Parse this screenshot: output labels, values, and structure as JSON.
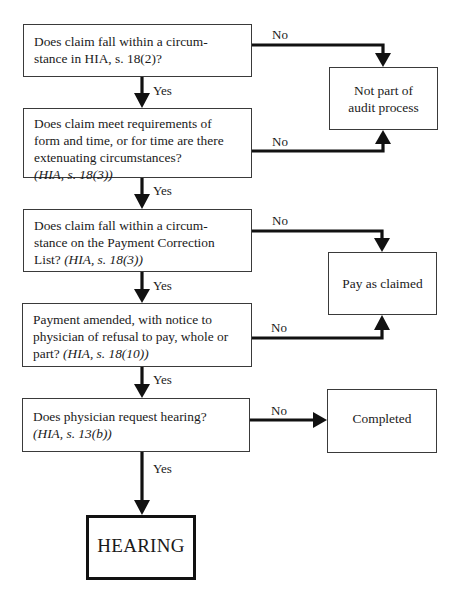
{
  "diagram": {
    "type": "flowchart",
    "decisions": [
      {
        "id": "q1",
        "text": "Does claim fall within a circum- stance in HIA, s. 18(2)?",
        "lines": [
          "Does claim fall within a circum-",
          "stance in HIA, s. 18(2)?"
        ],
        "ref": ""
      },
      {
        "id": "q2",
        "lines": [
          "Does claim meet requirements of",
          "form and time, or for time are there",
          "extenuating circumstances?"
        ],
        "ref": "(HIA, s. 18(3))"
      },
      {
        "id": "q3",
        "lines": [
          "Does claim fall within a circum-",
          "stance on the Payment Correction",
          "List? "
        ],
        "ref": "(HIA, s. 18(3))"
      },
      {
        "id": "q4",
        "lines": [
          "Payment amended, with notice to",
          "physician of refusal to pay, whole or",
          "part? "
        ],
        "ref": "(HIA, s. 18(10))"
      },
      {
        "id": "q5",
        "lines": [
          "Does physician request hearing?"
        ],
        "ref": "(HIA, s. 13(b))"
      }
    ],
    "outcomes": {
      "not_part": [
        "Not part of",
        "audit process"
      ],
      "pay": "Pay as claimed",
      "completed": "Completed",
      "hearing": "HEARING"
    },
    "edge_labels": {
      "yes": "Yes",
      "no": "No"
    },
    "edges": [
      {
        "from": "q1",
        "to": "not_part",
        "label": "No"
      },
      {
        "from": "q1",
        "to": "q2",
        "label": "Yes"
      },
      {
        "from": "q2",
        "to": "not_part",
        "label": "No"
      },
      {
        "from": "q2",
        "to": "q3",
        "label": "Yes"
      },
      {
        "from": "q3",
        "to": "pay",
        "label": "No"
      },
      {
        "from": "q3",
        "to": "q4",
        "label": "Yes"
      },
      {
        "from": "q4",
        "to": "pay",
        "label": "No"
      },
      {
        "from": "q4",
        "to": "q5",
        "label": "Yes"
      },
      {
        "from": "q5",
        "to": "completed",
        "label": "No"
      },
      {
        "from": "q5",
        "to": "hearing",
        "label": "Yes"
      }
    ]
  }
}
